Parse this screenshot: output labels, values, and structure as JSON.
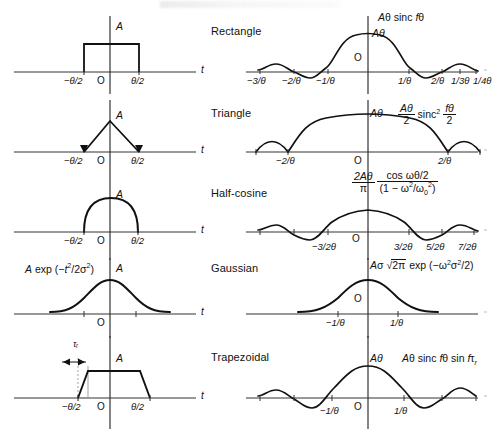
{
  "figure": {
    "type": "pulse-shapes-and-fourier-transforms-table",
    "columns": [
      "time-domain waveform",
      "shape name",
      "frequency-domain transform"
    ],
    "time_axis_label": "t",
    "origin_label": "O",
    "amplitude_label": "A"
  },
  "rows": [
    {
      "name": "Rectangle",
      "time": {
        "amplitude_label": "A",
        "origin": "O",
        "axis_label": "t",
        "ticks": [
          "−θ/2",
          "θ/2"
        ]
      },
      "freq": {
        "formula_plain": "Aθ sinc fθ",
        "peak_label": "Aθ",
        "origin": "O",
        "ticks_left": [
          "−3/θ",
          "−2/θ",
          "−1/θ"
        ],
        "ticks_right": [
          "1/θ",
          "2/θ",
          "1/3θ",
          "1/4θ"
        ]
      }
    },
    {
      "name": "Triangle",
      "time": {
        "amplitude_label": "A",
        "origin": "O",
        "axis_label": "t",
        "ticks": [
          "−θ/2",
          "θ/2"
        ]
      },
      "freq": {
        "formula_parts": {
          "num": "Aθ",
          "den": "2",
          "mid": "sinc",
          "exp": "2",
          "num2": "fθ",
          "den2": "2"
        },
        "peak_label": "Aθ",
        "origin": "O",
        "ticks_left": [
          "−2/θ"
        ],
        "ticks_right": [
          "2/θ"
        ]
      }
    },
    {
      "name": "Half-cosine",
      "time": {
        "amplitude_label": "A",
        "origin": "O",
        "axis_label": "t",
        "ticks": [
          "−θ/2",
          "θ/2"
        ]
      },
      "freq": {
        "formula_parts": {
          "num": "2Aθ",
          "den": "π",
          "num2": "cos ωθ/2",
          "den2": "(1 − ω²/ω₀²)"
        },
        "origin": "O",
        "ticks_left": [
          "−3/2θ"
        ],
        "ticks_right": [
          "3/2θ",
          "5/2θ",
          "7/2θ"
        ]
      }
    },
    {
      "name": "Gaussian",
      "time": {
        "formula_plain": "A exp (−t²/2σ²)",
        "amplitude_label": "A",
        "origin": "O",
        "axis_label": "t",
        "ticks": []
      },
      "freq": {
        "formula_plain": "Aσ √2π exp (−ω²σ²/2)",
        "origin": "O",
        "ticks_left": [
          "−1/θ"
        ],
        "ticks_right": [
          "1/θ"
        ]
      }
    },
    {
      "name": "Trapezoidal",
      "time": {
        "amplitude_label": "A",
        "rise_time_label": "τᵣ",
        "origin": "O",
        "axis_label": "t",
        "ticks": [
          "−θ/2",
          "θ/2"
        ]
      },
      "freq": {
        "formula_plain": "Aθ sinc fθ sin fτᵣ",
        "peak_label": "Aθ",
        "origin": "O",
        "ticks_left": [
          "−1/θ"
        ],
        "ticks_right": [
          "1/θ"
        ]
      }
    }
  ],
  "colors": {
    "ink": "#111111",
    "background": "#ffffff",
    "axis": "#333333"
  }
}
